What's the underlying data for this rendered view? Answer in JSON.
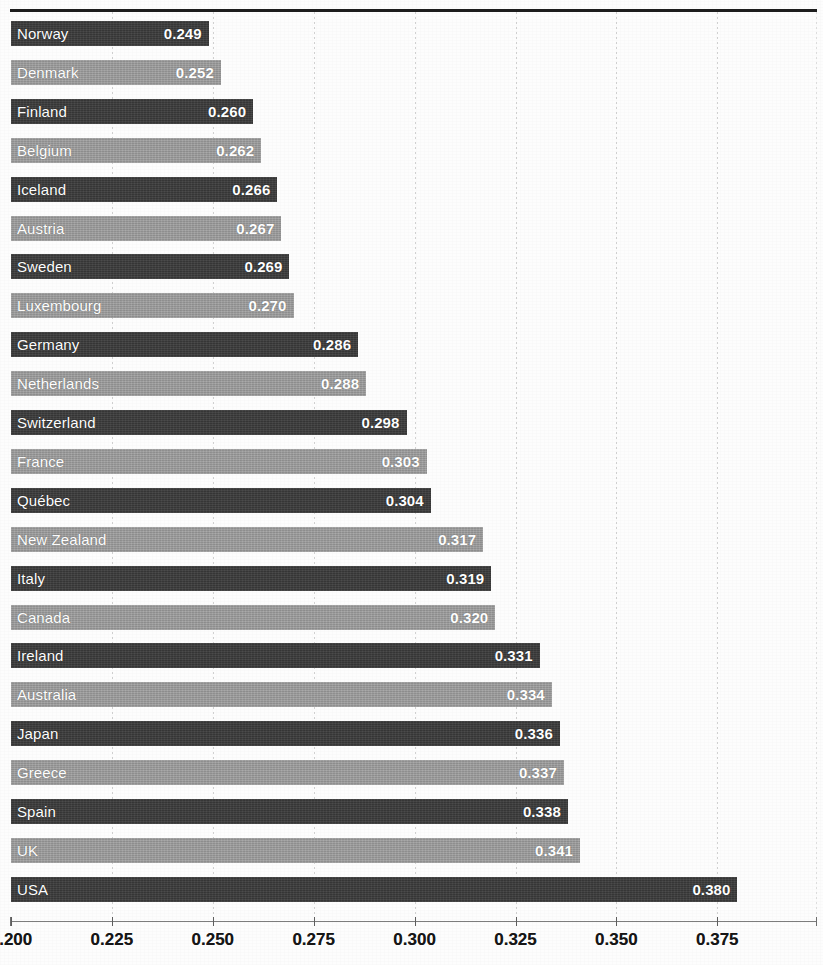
{
  "chart_data": {
    "type": "bar",
    "orientation": "horizontal",
    "title": "",
    "xlabel": "",
    "ylabel": "",
    "xlim": [
      0.2,
      0.388
    ],
    "grid": true,
    "legend": "none",
    "xticks": [
      "0.200",
      "0.225",
      "0.250",
      "0.275",
      "0.300",
      "0.325",
      "0.350",
      "0.375"
    ],
    "xtick_values": [
      0.2,
      0.225,
      0.25,
      0.275,
      0.3,
      0.325,
      0.35,
      0.375
    ],
    "value_format": "0.000",
    "categories": [
      "Norway",
      "Denmark",
      "Finland",
      "Belgium",
      "Iceland",
      "Austria",
      "Sweden",
      "Luxembourg",
      "Germany",
      "Netherlands",
      "Switzerland",
      "France",
      "Québec",
      "New Zealand",
      "Italy",
      "Canada",
      "Ireland",
      "Australia",
      "Japan",
      "Greece",
      "Spain",
      "UK",
      "USA"
    ],
    "values": [
      0.249,
      0.252,
      0.26,
      0.262,
      0.266,
      0.267,
      0.269,
      0.27,
      0.286,
      0.288,
      0.298,
      0.303,
      0.304,
      0.317,
      0.319,
      0.32,
      0.331,
      0.334,
      0.336,
      0.337,
      0.338,
      0.341,
      0.38
    ],
    "value_labels": [
      "0.249",
      "0.252",
      "0.260",
      "0.262",
      "0.266",
      "0.267",
      "0.269",
      "0.270",
      "0.286",
      "0.288",
      "0.298",
      "0.303",
      "0.304",
      "0.317",
      "0.319",
      "0.320",
      "0.331",
      "0.334",
      "0.336",
      "0.337",
      "0.338",
      "0.341",
      "0.380"
    ],
    "bar_shades": [
      "dark",
      "light",
      "dark",
      "light",
      "dark",
      "light",
      "dark",
      "light",
      "dark",
      "light",
      "dark",
      "light",
      "dark",
      "light",
      "dark",
      "light",
      "dark",
      "light",
      "dark",
      "light",
      "dark",
      "light",
      "dark"
    ],
    "colors": {
      "bar_dark": "#3b3b3b",
      "bar_light": "#9c9c9c",
      "bar_text": "#ffffff",
      "axis_text": "#161616",
      "gridline": "#c9c9c9",
      "frame": "#1d1d1d",
      "background": "#fdfdfd"
    }
  }
}
